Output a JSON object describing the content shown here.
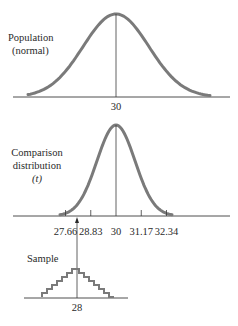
{
  "population": {
    "label_line1": "Population",
    "label_line2": "(normal)",
    "mean_label": "30",
    "mean": 30
  },
  "comparison": {
    "label_line1": "Comparison",
    "label_line2": "distribution",
    "label_line3": "(t)",
    "ticks": [
      {
        "value": 27.66,
        "label": "27.66"
      },
      {
        "value": 28.83,
        "label": "28.83"
      },
      {
        "value": 30,
        "label": "30"
      },
      {
        "value": 31.17,
        "label": "31.17"
      },
      {
        "value": 32.34,
        "label": "32.34"
      }
    ]
  },
  "sample": {
    "label": "Sample",
    "mean_label": "28",
    "mean": 28
  },
  "colors": {
    "curve": "#7a7a7a",
    "axis": "#3a3a3a",
    "text": "#2a2a2a"
  }
}
